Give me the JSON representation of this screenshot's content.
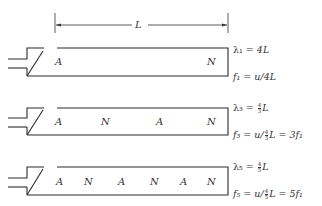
{
  "dimension": {
    "label": "L"
  },
  "pipes": [
    {
      "harmonic": 1,
      "nodes": [
        "A",
        "N"
      ],
      "wavelength_lhs": "λ₁",
      "wavelength_rhs": "4L",
      "frequency_lhs": "f₁",
      "frequency_rhs": "u/4L"
    },
    {
      "harmonic": 3,
      "nodes": [
        "A",
        "N",
        "A",
        "N"
      ],
      "wavelength_lhs": "λ₃",
      "wavelength_frac": {
        "num": "4",
        "den": "3"
      },
      "wavelength_rhs_suffix": "L",
      "frequency_lhs": "f₃",
      "frequency_prefix": "u/",
      "frequency_frac": {
        "num": "4",
        "den": "3"
      },
      "frequency_suffix": "L = 3f₁"
    },
    {
      "harmonic": 5,
      "nodes": [
        "A",
        "N",
        "A",
        "N",
        "A",
        "N"
      ],
      "wavelength_lhs": "λ₅",
      "wavelength_frac": {
        "num": "4",
        "den": "5"
      },
      "wavelength_rhs_suffix": "L",
      "frequency_lhs": "f₅",
      "frequency_prefix": "u/",
      "frequency_frac": {
        "num": "4",
        "den": "5"
      },
      "frequency_suffix": "L = 5f₁"
    }
  ],
  "colors": {
    "line": "#2b2b2b",
    "background": "#ffffff"
  }
}
